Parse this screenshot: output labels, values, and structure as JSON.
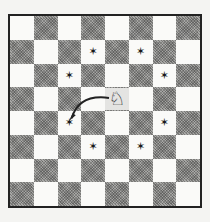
{
  "diagram": {
    "type": "chess-board",
    "size": 8,
    "orientation": "white-bottom",
    "light_color": "#fafaf8",
    "dark_color": "#8f8f8d",
    "border_color": "#222222",
    "piece": {
      "name": "knight",
      "glyph": "♘",
      "square": {
        "row": 3,
        "col": 4
      }
    },
    "markers": {
      "glyph": "✶",
      "squares": [
        {
          "row": 1,
          "col": 3
        },
        {
          "row": 1,
          "col": 5
        },
        {
          "row": 2,
          "col": 2
        },
        {
          "row": 2,
          "col": 6
        },
        {
          "row": 4,
          "col": 2
        },
        {
          "row": 4,
          "col": 6
        },
        {
          "row": 5,
          "col": 3
        },
        {
          "row": 5,
          "col": 5
        }
      ]
    },
    "arrow": {
      "from": {
        "row": 3,
        "col": 4
      },
      "to": {
        "row": 4,
        "col": 2
      },
      "color": "#222222"
    }
  }
}
